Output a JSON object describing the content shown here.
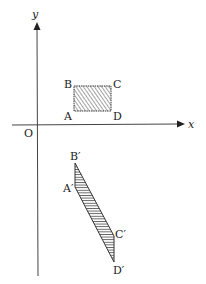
{
  "figure": {
    "width": 206,
    "height": 284,
    "background": "#ffffff",
    "stroke_color": "#333333",
    "axes": {
      "x_label": "x",
      "y_label": "y",
      "origin_label": "O"
    },
    "original_shape": {
      "name": "rectangle ABCD",
      "fill": "hatched",
      "vertices": {
        "A": "A",
        "B": "B",
        "C": "C",
        "D": "D"
      }
    },
    "transformed_shape": {
      "name": "parallelogram A'B'C'D'",
      "fill": "hatched",
      "vertices": {
        "A": "A′",
        "B": "B′",
        "C": "C′",
        "D": "D′"
      }
    }
  }
}
